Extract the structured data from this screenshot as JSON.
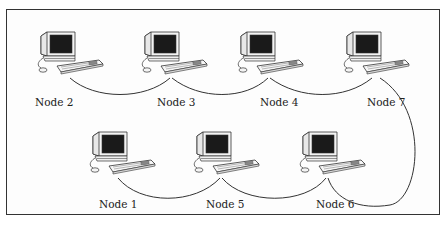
{
  "diagram": {
    "type": "network-topology",
    "nodes": [
      {
        "id": "node2",
        "label": "Node 2",
        "x": 33,
        "y": 30,
        "label_x": 35,
        "label_y": 96
      },
      {
        "id": "node3",
        "label": "Node 3",
        "x": 137,
        "y": 30,
        "label_x": 157,
        "label_y": 96
      },
      {
        "id": "node4",
        "label": "Node 4",
        "x": 233,
        "y": 30,
        "label_x": 260,
        "label_y": 96
      },
      {
        "id": "node7",
        "label": "Node 7",
        "x": 339,
        "y": 30,
        "label_x": 367,
        "label_y": 96
      },
      {
        "id": "node1",
        "label": "Node 1",
        "x": 85,
        "y": 130,
        "label_x": 99,
        "label_y": 198
      },
      {
        "id": "node5",
        "label": "Node 5",
        "x": 189,
        "y": 130,
        "label_x": 206,
        "label_y": 198
      },
      {
        "id": "node6",
        "label": "Node 6",
        "x": 295,
        "y": 130,
        "label_x": 316,
        "label_y": 198
      }
    ],
    "connections": [
      [
        "Node 2",
        "Node 3"
      ],
      [
        "Node 3",
        "Node 4"
      ],
      [
        "Node 4",
        "Node 7"
      ],
      [
        "Node 7",
        "Node 6"
      ],
      [
        "Node 6",
        "Node 5"
      ],
      [
        "Node 5",
        "Node 1"
      ]
    ],
    "colors": {
      "line": "#333333",
      "screen": "#1a1a1a",
      "border": "#333333",
      "background": "#ffffff"
    }
  }
}
